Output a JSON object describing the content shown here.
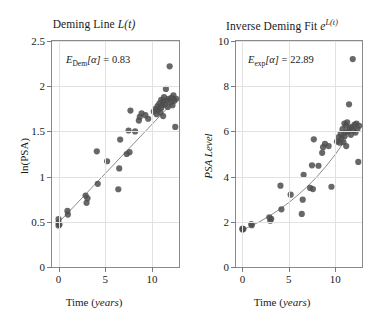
{
  "figure": {
    "width": 376,
    "height": 329,
    "marker_color": "#4d4d4d",
    "fit_line_color": "#8c8c8c",
    "grid_color": "#e2e2e2",
    "axis_color": "#8a8a8a"
  },
  "chart_data": [
    {
      "type": "scatter",
      "id": "deming-line",
      "title": "Deming Line L(t)",
      "title_plain": "Deming Line",
      "title_math": "L(t)",
      "annotation": "E_Dem[α] = 0.83",
      "annotation_symbol": "E",
      "annotation_sub": "Dem",
      "annotation_arg": "[α]",
      "annotation_value": "0.83",
      "xlabel": "Time (years)",
      "xlabel_plain": "Time",
      "xlabel_units": "years",
      "ylabel": "ln(PSA)",
      "xlim": [
        -0.7,
        12.9
      ],
      "ylim": [
        0,
        2.5
      ],
      "xticks": [
        0,
        5,
        10
      ],
      "yticks": [
        0,
        0.5,
        1,
        1.5,
        2,
        2.5
      ],
      "xticklabels": [
        "0",
        "5",
        "10"
      ],
      "yticklabels": [
        "0",
        "0.5",
        "1",
        "1.5",
        "2",
        "2.5"
      ],
      "grid": true,
      "legend": false,
      "series": [
        {
          "name": "observations",
          "marker": "filled-circle",
          "x": [
            0.0,
            0.0,
            0.0,
            0.1,
            0.95,
            1.0,
            2.9,
            3.0,
            3.1,
            4.1,
            4.2,
            5.2,
            6.4,
            6.5,
            6.6,
            7.3,
            7.5,
            7.6,
            7.7,
            8.2,
            8.6,
            8.7,
            8.9,
            9.3,
            9.6,
            10.2,
            10.4,
            10.5,
            10.6,
            10.7,
            10.8,
            10.9,
            11.0,
            11.0,
            11.1,
            11.2,
            11.2,
            11.3,
            11.4,
            11.5,
            11.6,
            11.7,
            11.8,
            11.9,
            12.0,
            12.1,
            12.2,
            12.3,
            12.4,
            12.5,
            12.6
          ],
          "y": [
            0.46,
            0.49,
            0.53,
            0.47,
            0.62,
            0.58,
            0.79,
            0.71,
            0.76,
            1.28,
            0.92,
            1.17,
            0.86,
            1.09,
            1.41,
            1.25,
            1.51,
            1.27,
            1.73,
            1.5,
            1.62,
            1.66,
            1.7,
            1.68,
            1.64,
            1.72,
            1.75,
            1.69,
            1.78,
            1.74,
            1.81,
            1.71,
            1.76,
            1.85,
            1.79,
            1.83,
            1.67,
            1.88,
            1.8,
            1.97,
            1.84,
            1.77,
            1.86,
            2.22,
            1.82,
            1.87,
            1.79,
            1.9,
            1.84,
            1.55,
            1.86
          ]
        },
        {
          "name": "deming-fit",
          "type": "line",
          "x": [
            0.0,
            12.6
          ],
          "y": [
            0.49,
            1.86
          ]
        }
      ]
    },
    {
      "type": "scatter",
      "id": "inverse-deming-fit",
      "title": "Inverse Deming Fit e^L(t)",
      "title_plain": "Inverse Deming Fit",
      "title_math": "e",
      "title_exp": "L(t)",
      "annotation": "E_exp[α] = 22.89",
      "annotation_symbol": "E",
      "annotation_sub": "exp",
      "annotation_arg": "[α]",
      "annotation_value": "22.89",
      "xlabel": "Time (years)",
      "xlabel_plain": "Time",
      "xlabel_units": "years",
      "ylabel": "PSA Level",
      "xlim": [
        -0.7,
        12.9
      ],
      "ylim": [
        0,
        10
      ],
      "xticks": [
        0,
        5,
        10
      ],
      "yticks": [
        0,
        2,
        4,
        6,
        8,
        10
      ],
      "xticklabels": [
        "0",
        "5",
        "10"
      ],
      "yticklabels": [
        "0",
        "2",
        "4",
        "6",
        "8",
        "10"
      ],
      "grid": true,
      "legend": false,
      "series": [
        {
          "name": "observations",
          "marker": "filled-circle",
          "x": [
            0.0,
            0.0,
            0.1,
            0.95,
            1.0,
            2.9,
            3.0,
            3.1,
            4.1,
            4.2,
            5.2,
            6.4,
            6.5,
            6.6,
            7.3,
            7.5,
            7.6,
            7.7,
            8.2,
            8.6,
            8.7,
            8.9,
            9.3,
            9.6,
            10.2,
            10.4,
            10.5,
            10.6,
            10.7,
            10.8,
            10.9,
            11.0,
            11.0,
            11.1,
            11.2,
            11.2,
            11.3,
            11.4,
            11.5,
            11.6,
            11.7,
            11.8,
            11.9,
            12.0,
            12.1,
            12.2,
            12.3,
            12.4,
            12.5,
            12.6
          ],
          "y": [
            1.7,
            1.66,
            1.68,
            1.9,
            1.85,
            2.2,
            2.05,
            2.13,
            3.6,
            2.55,
            3.2,
            2.35,
            2.98,
            4.08,
            3.5,
            4.5,
            3.45,
            5.65,
            4.48,
            5.05,
            5.3,
            5.45,
            5.35,
            3.55,
            5.55,
            5.75,
            5.5,
            5.9,
            5.7,
            6.1,
            5.52,
            5.8,
            6.35,
            5.95,
            6.25,
            5.35,
            6.4,
            6.0,
            7.2,
            6.15,
            5.85,
            6.2,
            9.2,
            6.05,
            6.3,
            5.95,
            6.35,
            6.1,
            4.65,
            6.25
          ]
        },
        {
          "name": "exp-fit",
          "type": "line",
          "x": [
            0.0,
            1.0,
            2.0,
            3.0,
            4.0,
            5.0,
            6.0,
            7.0,
            8.0,
            9.0,
            10.0,
            11.0,
            12.0,
            12.6
          ],
          "y": [
            1.63,
            1.83,
            2.04,
            2.28,
            2.55,
            2.85,
            3.19,
            3.56,
            3.98,
            4.45,
            4.97,
            5.56,
            6.21,
            6.45
          ]
        }
      ]
    }
  ]
}
